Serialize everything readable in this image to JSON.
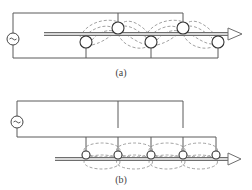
{
  "figure": {
    "panels": [
      {
        "id": "a",
        "caption": "(a)",
        "description": "Alternating coils above and below rod, connected to top and bottom supply wires",
        "source_symbol": "ac-source-icon",
        "upper_coil_count": 2,
        "lower_coil_count": 3
      },
      {
        "id": "b",
        "caption": "(b)",
        "description": "Five coils in a row along the rod, all fed from a common bottom wire",
        "source_symbol": "ac-source-icon",
        "coil_count": 5
      }
    ],
    "colors": {
      "wire": "#5a5a5a",
      "coil": "#333333",
      "field": "#8a8a8a",
      "rod": "#6e6e6e"
    }
  }
}
